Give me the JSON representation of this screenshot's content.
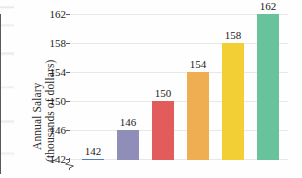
{
  "chart_data": {
    "type": "bar",
    "title": "",
    "xlabel": "",
    "ylabel": "Annual Salary (thousands of dollars)",
    "ylabel_line1": "Annual Salary",
    "ylabel_line2": "(thousands of dollars)",
    "categories": [
      "1",
      "2",
      "3",
      "4",
      "5",
      "6"
    ],
    "values": [
      142,
      146,
      150,
      154,
      158,
      162
    ],
    "data_labels": [
      "142",
      "146",
      "150",
      "154",
      "158",
      "162"
    ],
    "bar_colors": [
      "#4a80bd",
      "#8e8eb8",
      "#e25c5c",
      "#efae52",
      "#f2cf35",
      "#68c29a"
    ],
    "ylim": [
      140,
      162
    ],
    "yticks": [
      142,
      146,
      150,
      154,
      158,
      162
    ],
    "ytick_labels": [
      "142",
      "146",
      "150",
      "154",
      "158",
      "162"
    ],
    "grid": true,
    "grid_color": "#e8e8e8",
    "legend": "none",
    "axis_break": true,
    "axis_color": "#5a5a5a",
    "background": "#ffffff"
  }
}
